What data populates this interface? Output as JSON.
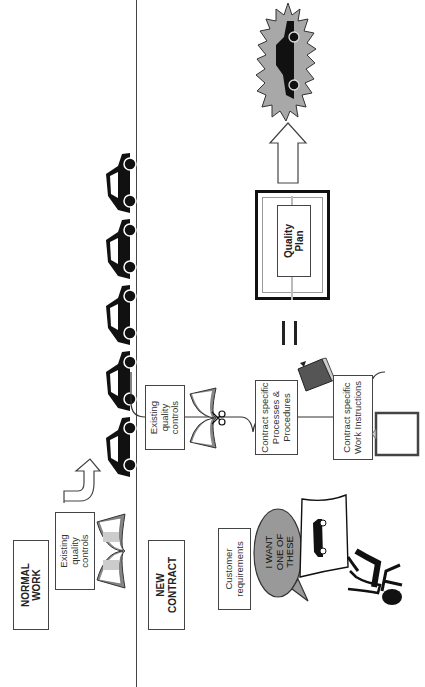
{
  "sections": {
    "normal_work": {
      "label": "NORMAL\nWORK",
      "controls_label": "Existing\nquality\ncontrols",
      "car_count": 5
    },
    "new_contract": {
      "label": "NEW\nCONTRACT",
      "customer_label": "Customer\nrequirements",
      "speech_bubble": "I WANT\nONE OF\nTHESE",
      "inputs": [
        {
          "label": "Existing\nquality\ncontrols",
          "icon": "open-book-with-scissors"
        },
        {
          "label": "Contract specific\nProcesses &\nProcedures",
          "icon": "closed-book"
        },
        {
          "label": "Contract specific\nWork Instructions",
          "icon": "clipboard"
        }
      ],
      "equals": "=",
      "result_label": "Quality\nPlan",
      "output_icon": "car-in-starburst"
    }
  },
  "colors": {
    "line": "#444444",
    "gray_fill": "#9a9a9a",
    "dark": "#111111",
    "book_gray": "#7a7a7a",
    "burst": "#a8a8a8"
  }
}
